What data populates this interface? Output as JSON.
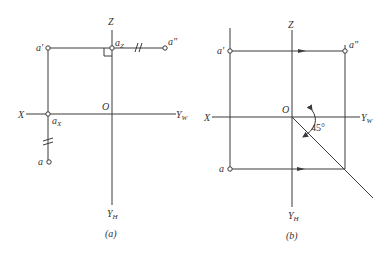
{
  "figure_a": {
    "caption": "(a)",
    "axes": {
      "z_label": "Z",
      "x_label": "X",
      "yw_label": "Y",
      "yw_sub": "W",
      "yh_label": "Y",
      "yh_sub": "H",
      "origin_label": "O"
    },
    "points": {
      "a_prime": "a'",
      "a_double_prime": "a\"",
      "a": "a",
      "az_label": "a",
      "az_sub": "Z",
      "ax_label": "a",
      "ax_sub": "X"
    },
    "equal_marks": "//"
  },
  "figure_b": {
    "caption": "(b)",
    "axes": {
      "z_label": "Z",
      "x_label": "X",
      "yw_label": "Y",
      "yw_sub": "W",
      "yh_label": "Y",
      "yh_sub": "H",
      "origin_label": "O"
    },
    "points": {
      "a_prime": "a'",
      "a_double_prime": "a\"",
      "a": "a"
    },
    "angle_label": "45°"
  },
  "colors": {
    "line": "#3a3a3a",
    "text": "#333333",
    "background": "#ffffff"
  }
}
